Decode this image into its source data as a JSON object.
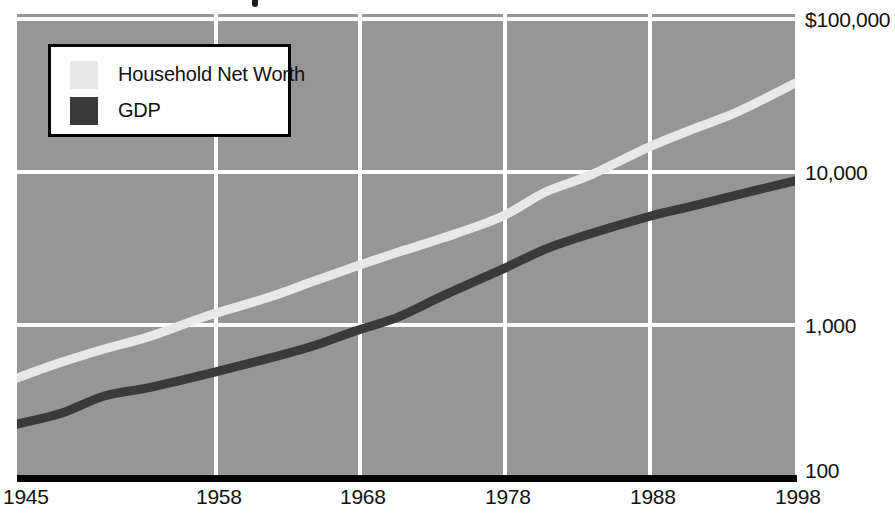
{
  "figure": {
    "background_color": "#ffffff",
    "plot_background_color": "#969696",
    "gridline_color": "#ffffff",
    "axis_bar_color": "#000000",
    "title_fragment": ""
  },
  "legend": {
    "position": "top-left-inside",
    "border_color": "#000000",
    "background_color": "#ffffff",
    "entries": [
      {
        "label": "Household Net Worth",
        "color": "#e8e8e8"
      },
      {
        "label": "GDP",
        "color": "#3a3a3a"
      }
    ]
  },
  "axes": {
    "y": {
      "scale": "log",
      "ticks": [
        "$100,000",
        "10,000",
        "1,000",
        "100"
      ],
      "tick_values": [
        100000,
        10000,
        1000,
        100
      ],
      "tick_y_px": [
        19,
        172,
        325,
        478
      ]
    },
    "x": {
      "scale": "linear",
      "ticks": [
        "1945",
        "1958",
        "1968",
        "1978",
        "1988",
        "1998"
      ],
      "tick_values": [
        1945,
        1958,
        1968,
        1978,
        1988,
        1998
      ],
      "tick_x_px": [
        17,
        216,
        360,
        505,
        650,
        795
      ]
    }
  },
  "chart_data": {
    "type": "line",
    "title": "",
    "subtitle": "",
    "xlabel": "",
    "ylabel": "",
    "yscale": "log",
    "ylim": [
      100,
      100000
    ],
    "xlim": [
      1945,
      1998
    ],
    "grid": true,
    "legend_position": "upper left",
    "y_tick_labels": [
      "$100,000",
      "10,000",
      "1,000",
      "100"
    ],
    "y_tick_values": [
      100000,
      10000,
      1000,
      100
    ],
    "x_tick_labels": [
      "1945",
      "1958",
      "1968",
      "1978",
      "1988",
      "1998"
    ],
    "x_tick_values": [
      1945,
      1958,
      1968,
      1978,
      1988,
      1998
    ],
    "x": [
      1945,
      1948,
      1951,
      1954,
      1958,
      1962,
      1965,
      1968,
      1971,
      1974,
      1978,
      1981,
      1984,
      1988,
      1991,
      1994,
      1998
    ],
    "series": [
      {
        "name": "Household Net Worth",
        "color": "#e8e8e8",
        "line_width_px": 9,
        "values": [
          450,
          570,
          700,
          840,
          1150,
          1500,
          1900,
          2400,
          3000,
          3700,
          5100,
          7400,
          9500,
          14500,
          19000,
          24500,
          38000
        ]
      },
      {
        "name": "GDP",
        "color": "#3a3a3a",
        "line_width_px": 9,
        "values": [
          225,
          265,
          345,
          390,
          480,
          600,
          720,
          910,
          1130,
          1550,
          2300,
          3130,
          3930,
          5100,
          5990,
          7070,
          8750
        ]
      }
    ]
  }
}
